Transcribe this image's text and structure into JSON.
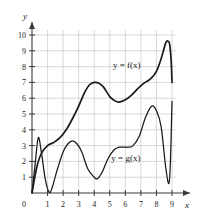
{
  "figure": {
    "kind": "math-function-graph",
    "background": "#ffffff",
    "grid_color": "#c9c9c9",
    "axis_color": "#3a3a3a",
    "curve_color": "#1a1a1a"
  },
  "axes": {
    "x_axis_label": "x",
    "y_axis_label": "y",
    "origin_label": "0",
    "x_ticks": [
      "1",
      "2",
      "3",
      "4",
      "5",
      "6",
      "7",
      "8",
      "9"
    ],
    "y_ticks": [
      "1",
      "2",
      "3",
      "4",
      "5",
      "6",
      "7",
      "8",
      "9",
      "10"
    ]
  },
  "labels": {
    "f_label": "y = f(x)",
    "g_label": "y = g(x)"
  },
  "chart_data": {
    "type": "line",
    "title": "",
    "xlabel": "x",
    "ylabel": "y",
    "xlim": [
      0,
      9
    ],
    "ylim": [
      0,
      10
    ],
    "grid": true,
    "legend": "inline-annotations",
    "series": [
      {
        "name": "y = f(x)",
        "label_position": {
          "x": 5.2,
          "y": 7.9
        },
        "x": [
          0,
          0.3,
          0.6,
          1.0,
          1.4,
          1.8,
          2.2,
          2.6,
          3.0,
          3.4,
          3.7,
          4.0,
          4.3,
          4.6,
          5.0,
          5.3,
          5.6,
          6.0,
          6.4,
          6.8,
          7.2,
          7.6,
          8.0,
          8.3,
          8.6,
          8.75,
          8.85,
          8.95,
          9.0
        ],
        "y": [
          0,
          1.6,
          2.5,
          3.0,
          3.2,
          3.5,
          4.0,
          4.7,
          5.5,
          6.4,
          6.85,
          7.0,
          6.95,
          6.7,
          6.1,
          5.85,
          5.75,
          5.9,
          6.2,
          6.6,
          6.95,
          7.2,
          7.7,
          8.5,
          9.5,
          9.6,
          9.4,
          8.3,
          7.0
        ]
      },
      {
        "name": "y = g(x)",
        "label_position": {
          "x": 5.1,
          "y": 2.0
        },
        "x": [
          0,
          0.2,
          0.4,
          0.6,
          0.85,
          1.1,
          1.3,
          1.6,
          2.0,
          2.3,
          2.6,
          2.9,
          3.2,
          3.6,
          4.0,
          4.2,
          4.5,
          4.9,
          5.3,
          5.6,
          5.9,
          6.2,
          6.5,
          6.9,
          7.3,
          7.7,
          8.0,
          8.3,
          8.6,
          8.8,
          8.9,
          9.0
        ],
        "y": [
          0,
          1.8,
          3.5,
          2.6,
          0.9,
          0.05,
          0.35,
          1.4,
          2.6,
          3.1,
          3.3,
          3.1,
          2.6,
          1.5,
          1.0,
          0.9,
          1.3,
          2.2,
          2.75,
          2.9,
          2.9,
          2.9,
          3.0,
          3.6,
          4.8,
          5.5,
          5.2,
          4.2,
          1.6,
          0.6,
          2.0,
          5.8
        ]
      }
    ]
  }
}
